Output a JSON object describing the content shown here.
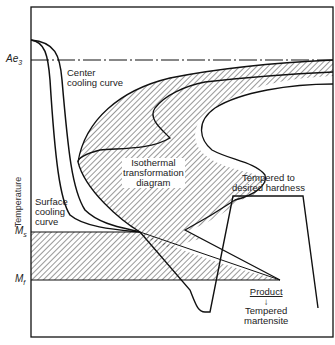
{
  "figure": {
    "type": "Isothermal transformation (TTT) diagram with cooling curves - quench and temper process",
    "y_axis_label": "Temperature",
    "y_axis_markers": {
      "ae3": {
        "base": "Ae",
        "sub": "3"
      },
      "ms": {
        "base": "M",
        "sub": "s"
      },
      "mf": {
        "base": "M",
        "sub": "f"
      }
    },
    "labels": {
      "center_cooling_curve": [
        "Center",
        "cooling curve"
      ],
      "surface_cooling_curve": [
        "Surface",
        "cooling",
        "curve"
      ],
      "isothermal_diagram": [
        "Isothermal",
        "transformation",
        "diagram"
      ],
      "tempered": [
        "Tempered to",
        "desired hardness"
      ],
      "product_heading": "Product",
      "product_arrow": "↓",
      "product": [
        "Tempered",
        "martensite"
      ]
    },
    "colors": {
      "line": "#111111",
      "hatch": "#333333",
      "background": "#ffffff"
    }
  }
}
